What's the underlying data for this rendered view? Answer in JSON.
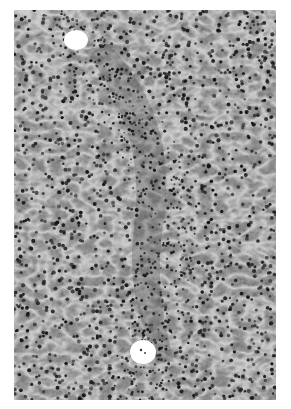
{
  "image": {
    "type": "grayscale histology micrograph",
    "subject": "liver tissue section with hepatocytes and dense nuclear infiltrate",
    "background_color": "#ffffff",
    "tissue_base_color": "#8e8e8e",
    "nucleus_color": "#1a1a1a",
    "sinusoid_color": "#d8d8d8",
    "features": [
      {
        "name": "central-vein-upper",
        "cx": 76,
        "cy": 40,
        "rx": 12,
        "ry": 10,
        "color": "#ffffff"
      },
      {
        "name": "central-vein-lower",
        "cx": 143,
        "cy": 352,
        "rx": 13,
        "ry": 12,
        "color": "#ffffff"
      },
      {
        "name": "inflammatory-band",
        "description": "diagonal band of densely packed small nuclei connecting the two vessels"
      }
    ],
    "frame": {
      "left": 14,
      "top": 10,
      "width": 262,
      "height": 390
    }
  }
}
